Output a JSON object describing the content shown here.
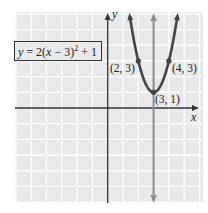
{
  "chart_data": {
    "type": "line",
    "title": "",
    "equation_label": "y = 2(x − 3)² + 1",
    "xlabel": "x",
    "ylabel": "y",
    "xlim": [
      -6,
      6
    ],
    "ylim": [
      -6,
      6
    ],
    "grid": true,
    "series": [
      {
        "name": "y = 2(x − 3)² + 1",
        "kind": "parabola",
        "formula": "2*(x-3)^2+1",
        "points": [
          {
            "x": 2,
            "y": 3,
            "label": "(2, 3)"
          },
          {
            "x": 3,
            "y": 1,
            "label": "(3, 1)"
          },
          {
            "x": 4,
            "y": 3,
            "label": "(4, 3)"
          }
        ],
        "color": "#444444"
      },
      {
        "name": "axis of symmetry",
        "kind": "vertical_line",
        "x": 3,
        "color": "#8c8c8c"
      }
    ],
    "legend_position": "upper-left box"
  },
  "labels": {
    "equation": {
      "y": "y",
      "eq": " = 2(",
      "x": "x",
      "rest": " − 3)",
      "sup": "2",
      "tail": " + 1"
    },
    "x_axis": "x",
    "y_axis": "y",
    "p1": "(2, 3)",
    "p2": "(4, 3)",
    "vertex": "(3, 1)"
  },
  "colors": {
    "grid_bg": "#e9e9e9",
    "grid_line": "#ffffff",
    "axis": "#333333",
    "curve": "#444444",
    "symmetry_line": "#8c8c8c"
  }
}
